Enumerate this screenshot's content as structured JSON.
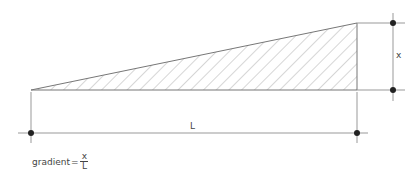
{
  "diagram": {
    "labels": {
      "height": "x",
      "length": "L"
    },
    "formula": {
      "lhs": "gradient",
      "equals": "=",
      "numerator": "x",
      "denominator": "L"
    },
    "colors": {
      "line": "#888888",
      "hatch": "#999999",
      "dot": "#222222"
    }
  }
}
